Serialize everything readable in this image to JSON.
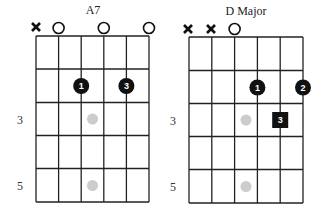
{
  "colors": {
    "grid": "#222222",
    "finger_dot": "#111111",
    "finger_text": "#ffffff",
    "position_marker": "#cccccc",
    "background": "#ffffff"
  },
  "diagrams": [
    {
      "title": "A7",
      "strings": 6,
      "frets_shown": 5,
      "fret_labels": [
        {
          "fret": 3,
          "label": "3"
        },
        {
          "fret": 5,
          "label": "5"
        }
      ],
      "string_status": [
        "x",
        "o",
        "",
        "o",
        "",
        "o"
      ],
      "fingers": [
        {
          "string": 3,
          "fret": 2,
          "finger": "1",
          "shape": "circle"
        },
        {
          "string": 5,
          "fret": 2,
          "finger": "3",
          "shape": "circle"
        }
      ],
      "position_markers": [
        {
          "fret": 3
        },
        {
          "fret": 5
        }
      ]
    },
    {
      "title": "D Major",
      "strings": 6,
      "frets_shown": 5,
      "fret_labels": [
        {
          "fret": 3,
          "label": "3"
        },
        {
          "fret": 5,
          "label": "5"
        }
      ],
      "string_status": [
        "x",
        "x",
        "o",
        "",
        "",
        ""
      ],
      "fingers": [
        {
          "string": 4,
          "fret": 2,
          "finger": "1",
          "shape": "circle"
        },
        {
          "string": 6,
          "fret": 2,
          "finger": "2",
          "shape": "circle"
        },
        {
          "string": 5,
          "fret": 3,
          "finger": "3",
          "shape": "square"
        }
      ],
      "position_markers": [
        {
          "fret": 3
        },
        {
          "fret": 5
        }
      ]
    }
  ]
}
